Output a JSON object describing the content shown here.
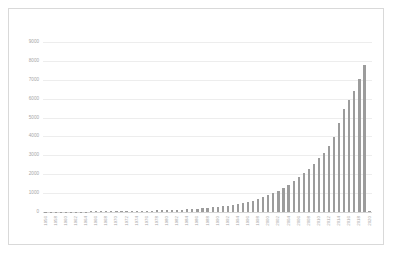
{
  "chart_data": {
    "type": "bar",
    "title": "",
    "subtitle": "",
    "xlabel": "",
    "ylabel": "",
    "ylim": [
      0,
      9000
    ],
    "ytick_values": [
      9000,
      8000,
      7000,
      6000,
      5000,
      4000,
      3000,
      2000,
      1000,
      0
    ],
    "ytick_labels": [
      "9000",
      "8000",
      "7000",
      "6000",
      "5000",
      "4000",
      "3000",
      "2000",
      "1000",
      "0"
    ],
    "grid": true,
    "legend": null,
    "bar_color": "#9c9c9c",
    "label_color": "#a6a6a6",
    "gridline_color": "#ededed",
    "border_color": "#d9d9d9",
    "background_color": "#ffffff",
    "xtick_label_every": 2,
    "categories": [
      "1956",
      "1957",
      "1958",
      "1959",
      "1960",
      "1961",
      "1962",
      "1963",
      "1964",
      "1965",
      "1966",
      "1967",
      "1968",
      "1969",
      "1970",
      "1971",
      "1972",
      "1973",
      "1974",
      "1975",
      "1976",
      "1977",
      "1978",
      "1979",
      "1980",
      "1981",
      "1982",
      "1983",
      "1984",
      "1985",
      "1986",
      "1987",
      "1988",
      "1989",
      "1990",
      "1991",
      "1992",
      "1993",
      "1994",
      "1995",
      "1996",
      "1997",
      "1998",
      "1999",
      "2000",
      "2001",
      "2002",
      "2003",
      "2004",
      "2005",
      "2006",
      "2007",
      "2008",
      "2009",
      "2010",
      "2011",
      "2012",
      "2013",
      "2014",
      "2015",
      "2016",
      "2017",
      "2018",
      "2019",
      "2020"
    ],
    "xtick_labels_shown": [
      "1956",
      "1958",
      "1960",
      "1962",
      "1964",
      "1966",
      "1968",
      "1970",
      "1972",
      "1974",
      "1976",
      "1978",
      "1980",
      "1982",
      "1984",
      "1986",
      "1988",
      "1990",
      "1992",
      "1994",
      "1996",
      "1998",
      "2000",
      "2002",
      "2004",
      "2006",
      "2008",
      "2010",
      "2012",
      "2014",
      "2016",
      "2018",
      "2020"
    ],
    "values": [
      8,
      10,
      12,
      14,
      16,
      18,
      20,
      22,
      25,
      28,
      30,
      33,
      36,
      40,
      44,
      48,
      52,
      57,
      62,
      68,
      74,
      80,
      88,
      95,
      104,
      112,
      122,
      132,
      145,
      158,
      175,
      195,
      215,
      240,
      270,
      300,
      335,
      375,
      420,
      470,
      530,
      600,
      680,
      770,
      880,
      1000,
      1130,
      1280,
      1450,
      1630,
      1830,
      2050,
      2300,
      2560,
      2850,
      3150,
      3500,
      3950,
      4700,
      5450,
      5950,
      6400,
      7050,
      7800,
      60
    ]
  }
}
